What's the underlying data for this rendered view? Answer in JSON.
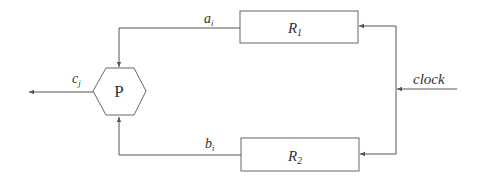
{
  "diagram": {
    "processor": {
      "label": "P"
    },
    "registers": [
      {
        "label_main": "R",
        "label_sub": "1"
      },
      {
        "label_main": "R",
        "label_sub": "2"
      }
    ],
    "signals": {
      "a": {
        "main": "a",
        "sub": "i"
      },
      "b": {
        "main": "b",
        "sub": "i"
      },
      "c": {
        "main": "c",
        "sub": "j"
      },
      "clock": "clock"
    },
    "colors": {
      "stroke": "#555555",
      "text": "#333333",
      "background": "#ffffff"
    }
  }
}
